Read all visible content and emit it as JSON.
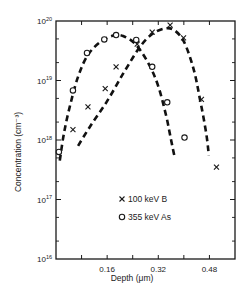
{
  "chart_data": {
    "type": "scatter",
    "title": "",
    "xlabel": "Depth (μm)",
    "ylabel": "Concentration (cm⁻³)",
    "xlim": [
      0,
      0.56
    ],
    "ylim": [
      1e+16,
      1e+20
    ],
    "yscale": "log",
    "x_ticks": [
      0.08,
      0.16,
      0.24,
      0.32,
      0.4,
      0.48
    ],
    "x_tick_labels": [
      {
        "value": 0.16,
        "label": "0.16"
      },
      {
        "value": 0.32,
        "label": "0.32"
      },
      {
        "value": 0.48,
        "label": "0.48"
      }
    ],
    "y_tick_labels": [
      {
        "exp": 20,
        "base": "10",
        "sup": "20"
      },
      {
        "exp": 19,
        "base": "10",
        "sup": "19"
      },
      {
        "exp": 18,
        "base": "10",
        "sup": "18"
      },
      {
        "exp": 17,
        "base": "10",
        "sup": "17"
      },
      {
        "exp": 16,
        "base": "10",
        "sup": "16"
      }
    ],
    "grid": false,
    "legend_position": "lower-center inside plot",
    "series": [
      {
        "name": "100 keV B",
        "marker": "x",
        "legend_label": "100 keV B",
        "points": [
          {
            "x": 0.053,
            "y": 1.5e+18
          },
          {
            "x": 0.1,
            "y": 3.6e+18
          },
          {
            "x": 0.154,
            "y": 7.3e+18
          },
          {
            "x": 0.188,
            "y": 1.7e+19
          },
          {
            "x": 0.254,
            "y": 4.1e+19
          },
          {
            "x": 0.301,
            "y": 6.5e+19
          },
          {
            "x": 0.357,
            "y": 8.5e+19
          },
          {
            "x": 0.399,
            "y": 5.2e+19
          },
          {
            "x": 0.455,
            "y": 4.8e+18
          },
          {
            "x": 0.502,
            "y": 3.5e+17
          }
        ],
        "fit_curve": [
          {
            "x": 0.069,
            "y": 8e+17
          },
          {
            "x": 0.11,
            "y": 1.8e+18
          },
          {
            "x": 0.16,
            "y": 4.5e+18
          },
          {
            "x": 0.21,
            "y": 1.3e+19
          },
          {
            "x": 0.26,
            "y": 3.5e+19
          },
          {
            "x": 0.3,
            "y": 6e+19
          },
          {
            "x": 0.34,
            "y": 7.5e+19
          },
          {
            "x": 0.37,
            "y": 7e+19
          },
          {
            "x": 0.4,
            "y": 4.5e+19
          },
          {
            "x": 0.43,
            "y": 1.6e+19
          },
          {
            "x": 0.45,
            "y": 5e+18
          },
          {
            "x": 0.47,
            "y": 1.3e+18
          },
          {
            "x": 0.478,
            "y": 5.5e+17
          }
        ]
      },
      {
        "name": "355 keV As",
        "marker": "o",
        "legend_label": "355 keV As",
        "points": [
          {
            "x": 0.009,
            "y": 6.3e+17
          },
          {
            "x": 0.053,
            "y": 6.8e+18
          },
          {
            "x": 0.097,
            "y": 2.9e+19
          },
          {
            "x": 0.151,
            "y": 4.9e+19
          },
          {
            "x": 0.188,
            "y": 5.8e+19
          },
          {
            "x": 0.251,
            "y": 4.8e+19
          },
          {
            "x": 0.301,
            "y": 1.7e+19
          },
          {
            "x": 0.348,
            "y": 4.3e+18
          },
          {
            "x": 0.402,
            "y": 1.1e+18
          }
        ],
        "fit_curve": [
          {
            "x": 0.012,
            "y": 4.5e+17
          },
          {
            "x": 0.025,
            "y": 1.3e+18
          },
          {
            "x": 0.045,
            "y": 4e+18
          },
          {
            "x": 0.07,
            "y": 1.2e+19
          },
          {
            "x": 0.1,
            "y": 2.7e+19
          },
          {
            "x": 0.14,
            "y": 4.5e+19
          },
          {
            "x": 0.18,
            "y": 5.7e+19
          },
          {
            "x": 0.21,
            "y": 5.6e+19
          },
          {
            "x": 0.25,
            "y": 4e+19
          },
          {
            "x": 0.29,
            "y": 1.9e+19
          },
          {
            "x": 0.32,
            "y": 8e+18
          },
          {
            "x": 0.345,
            "y": 2.5e+18
          },
          {
            "x": 0.36,
            "y": 1e+18
          },
          {
            "x": 0.37,
            "y": 5.5e+17
          }
        ]
      }
    ]
  }
}
